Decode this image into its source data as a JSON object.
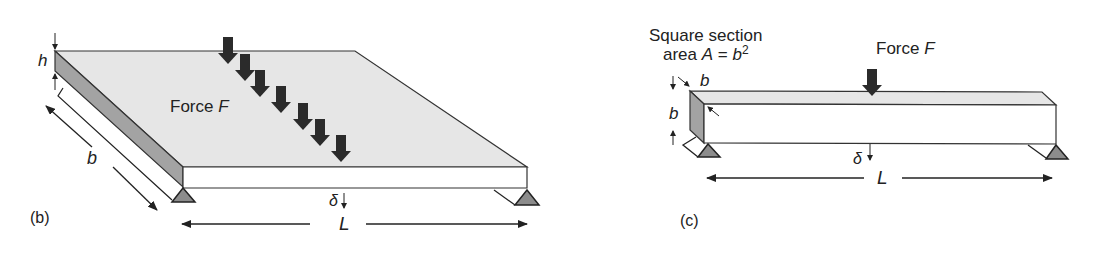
{
  "panel_b": {
    "label": "(b)",
    "force_label": "Force",
    "force_symbol": "F",
    "dim_height": "h",
    "dim_width": "b",
    "dim_length": "L",
    "deflection": "δ",
    "load_arrow_count": 7
  },
  "panel_c": {
    "label": "(c)",
    "section_line1": "Square section",
    "section_line2_prefix": "area",
    "section_area_symbol": "A",
    "section_equals": "=",
    "section_area_value": "b",
    "section_area_exp": "2",
    "force_label": "Force",
    "force_symbol": "F",
    "dim_width": "b",
    "dim_height": "b",
    "dim_length": "L",
    "deflection": "δ"
  },
  "colors": {
    "top_face": "#e6e6e6",
    "side_face": "#a3a3a3",
    "front_face": "#ffffff",
    "support": "#8c8c8c",
    "arrow": "#2b2b2b",
    "line": "#222222"
  }
}
